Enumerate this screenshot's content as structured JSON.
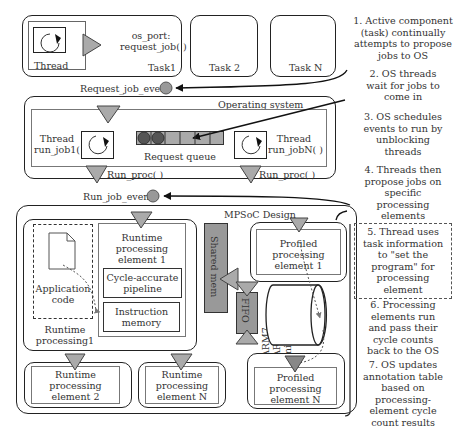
{
  "tasks": {
    "task1": {
      "label": "Task1",
      "thread_label": "Thread",
      "port_label_line1": "os_port:",
      "port_label_line2": "request_job( )"
    },
    "task2": {
      "label": "Task 2"
    },
    "taskN": {
      "label": "Task N"
    }
  },
  "events": {
    "request_job_event": "Request_job_event",
    "run_job_event": "Run_job_event"
  },
  "operating_system": {
    "title": "Operating system",
    "thread1_line1": "Thread",
    "thread1_line2": "run_job1( )",
    "threadN_line1": "Thread",
    "threadN_line2": "run_jobN( )",
    "queue_label": "Request queue",
    "queue_slots": 6,
    "queue_filled": 2,
    "run_proc_left": "Run_proc( )",
    "run_proc_right": "Run_proc( )"
  },
  "mpsoc": {
    "title": "MPSoC Design",
    "runtime1": {
      "app_code_line1": "Application",
      "app_code_line2": "code",
      "pe_line1": "Runtime",
      "pe_line2": "processing",
      "pe_line3": "element 1",
      "pipeline_line1": "Cycle-accurate",
      "pipeline_line2": "pipeline",
      "imem_line1": "Instruction",
      "imem_line2": "memory",
      "label_line1": "Runtime",
      "label_line2": "processing1"
    },
    "shared_mem": "Shared mem",
    "fifo": "FIFO",
    "processors": {
      "line1": "ARM7",
      "line2": "ARM9",
      "line3": "microblaze"
    },
    "profiled1": {
      "line1": "Profiled",
      "line2": "processing",
      "line3": "element 1"
    },
    "profiledN": {
      "line1": "Profiled",
      "line2": "processing",
      "line3": "element N"
    },
    "runtime2": {
      "line1": "Runtime",
      "line2": "processing",
      "line3": "element 2"
    },
    "runtimeN": {
      "line1": "Runtime",
      "line2": "processing",
      "line3": "element N"
    }
  },
  "notes": [
    {
      "id": 1,
      "lines": [
        "1. Active component",
        "(task) continually",
        "attempts to propose",
        "jobs to OS"
      ]
    },
    {
      "id": 2,
      "lines": [
        "2. OS threads",
        "wait for jobs to",
        "come in"
      ]
    },
    {
      "id": 3,
      "lines": [
        "3. OS schedules",
        "events to run by",
        "unblocking",
        "threads"
      ]
    },
    {
      "id": 4,
      "lines": [
        "4. Threads then",
        "propose jobs on",
        "specific",
        "processing",
        "elements"
      ]
    },
    {
      "id": 5,
      "lines": [
        "5. Thread uses",
        "task information",
        "to \"set the",
        "program\" for",
        "processing",
        "element"
      ]
    },
    {
      "id": 6,
      "lines": [
        "6. Processing",
        "elements run",
        "and pass their",
        "cycle counts",
        "back to the OS"
      ]
    },
    {
      "id": 7,
      "lines": [
        "7. OS updates",
        "annotation table",
        "based on",
        "processing-",
        "element cycle",
        "count results"
      ]
    }
  ],
  "colors": {
    "gray_fill": "#999999",
    "dark_circle": "#555555",
    "line": "#222222"
  }
}
